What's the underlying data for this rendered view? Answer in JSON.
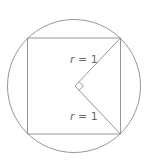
{
  "figure": {
    "labels": [
      {
        "id": "upper-radius",
        "var": "r",
        "rest": " = 1"
      },
      {
        "id": "lower-radius",
        "var": "r",
        "rest": " = 1"
      }
    ],
    "colors": {
      "stroke": "#8a8a8a",
      "text": "#6a6a6a",
      "background": "#ffffff"
    }
  }
}
